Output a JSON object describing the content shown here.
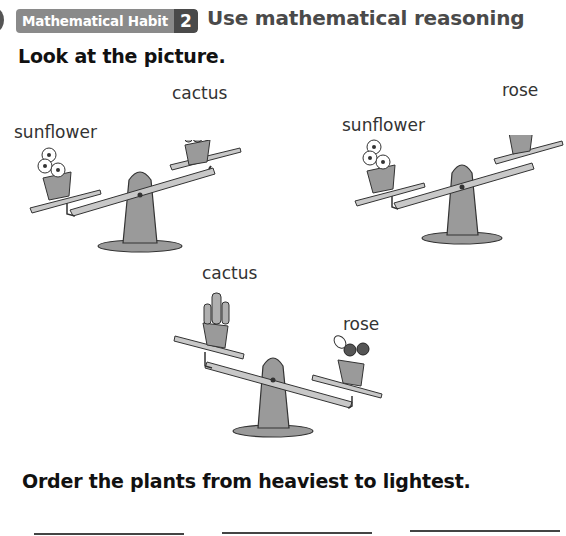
{
  "header": {
    "habit_label": "Mathematical Habit",
    "habit_number": "2",
    "habit_title": "Use mathematical reasoning"
  },
  "instruction": "Look at the picture.",
  "scales": [
    {
      "left_plant": "sunflower",
      "right_plant": "cactus",
      "heavier_side": "left"
    },
    {
      "left_plant": "sunflower",
      "right_plant": "rose",
      "heavier_side": "left"
    },
    {
      "left_plant": "cactus",
      "right_plant": "rose",
      "heavier_side": "right"
    }
  ],
  "question": "Order the plants from heaviest to lightest.",
  "answers": [
    "",
    "",
    ""
  ],
  "colors": {
    "badge_bg": "#8a8a8a",
    "badge_num_bg": "#4a4a4a",
    "scale_fill": "#9a9a9a",
    "text": "#111111"
  }
}
